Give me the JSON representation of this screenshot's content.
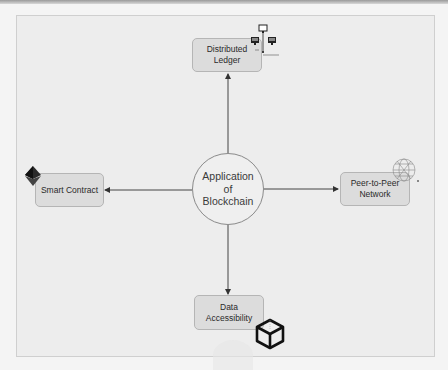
{
  "diagram": {
    "title": "Application of Blockchain",
    "center": {
      "lines": [
        "Application",
        "of",
        "Blockchain"
      ]
    },
    "nodes": [
      {
        "id": "distributed-ledger",
        "lines": [
          "Distributed",
          "Ledger"
        ],
        "icon": "network-computers-icon",
        "direction": "up"
      },
      {
        "id": "smart-contract",
        "lines": [
          "Smart Contract"
        ],
        "icon": "ethereum-diamond-icon",
        "direction": "left"
      },
      {
        "id": "peer-to-peer-network",
        "lines": [
          "Peer-to-Peer",
          "Network"
        ],
        "icon": "globe-mesh-icon",
        "direction": "right"
      },
      {
        "id": "data-accessibility",
        "lines": [
          "Data",
          "Accessibility"
        ],
        "icon": "cube-icon",
        "direction": "down"
      }
    ],
    "colors": {
      "canvas": "#ededed",
      "node_fill": "#dcdcdc",
      "node_border": "#b5b5b5",
      "center_border": "#8a8a8a",
      "arrow": "#333333"
    }
  }
}
